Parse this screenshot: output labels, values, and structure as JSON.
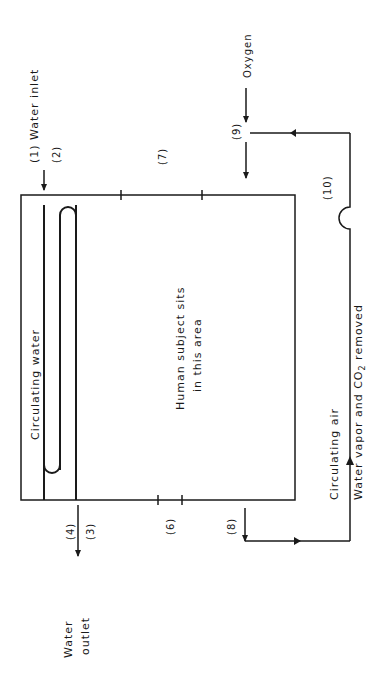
{
  "figure": {
    "orientation": "rotated-90-ccw",
    "colors": {
      "ink": "#1a1a1a",
      "background": "#ffffff"
    }
  },
  "labels": {
    "water_inlet": "(1) Water inlet",
    "point_2": "(2)",
    "point_3": "(3)",
    "point_4": "(4)",
    "point_6": "(6)",
    "point_7": "(7)",
    "point_8": "(8)",
    "point_9": "(9)",
    "point_10": "(10)",
    "oxygen": "Oxygen",
    "circulating_water": "Circulating water",
    "human_line1": "Human subject sits",
    "human_line2": "in this area",
    "circulating_air": "Circulating air",
    "removed_prefix": "Water vapor and CO",
    "removed_sub": "2",
    "removed_suffix": " removed",
    "water_outlet_line1": "Water",
    "water_outlet_line2": "outlet"
  }
}
